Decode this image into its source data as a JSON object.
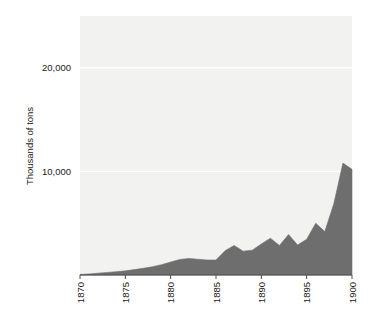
{
  "chart_data": {
    "type": "area",
    "title": "",
    "xlabel": "",
    "ylabel": "Thousands of tons",
    "xlim": [
      1870,
      1900
    ],
    "ylim": [
      0,
      25000
    ],
    "grid": true,
    "legend": "none",
    "series_color": "#6e6e6e",
    "plot_background": "#f2f2f0",
    "gridline_color": "#ffffff",
    "axis_color": "#4d4d4d",
    "xticks": [
      1870,
      1875,
      1880,
      1885,
      1890,
      1895,
      1900
    ],
    "xtick_labels": [
      "1870",
      "1875",
      "1880",
      "1885",
      "1890",
      "1895",
      "1900"
    ],
    "xtick_rotation": 90,
    "yticks": [
      10000,
      20000
    ],
    "ytick_labels": [
      "10,000",
      "20,000"
    ],
    "x": [
      1870,
      1871,
      1872,
      1873,
      1874,
      1875,
      1876,
      1877,
      1878,
      1879,
      1880,
      1881,
      1882,
      1883,
      1884,
      1885,
      1886,
      1887,
      1888,
      1889,
      1890,
      1891,
      1892,
      1893,
      1894,
      1895,
      1896,
      1897,
      1898,
      1899,
      1900
    ],
    "values": [
      50,
      100,
      180,
      250,
      320,
      400,
      520,
      650,
      800,
      1000,
      1250,
      1500,
      1600,
      1520,
      1450,
      1450,
      2350,
      2850,
      2300,
      2400,
      3000,
      3550,
      2850,
      3900,
      2900,
      3450,
      5000,
      4200,
      6900,
      10800,
      10200
    ],
    "annotations": []
  }
}
